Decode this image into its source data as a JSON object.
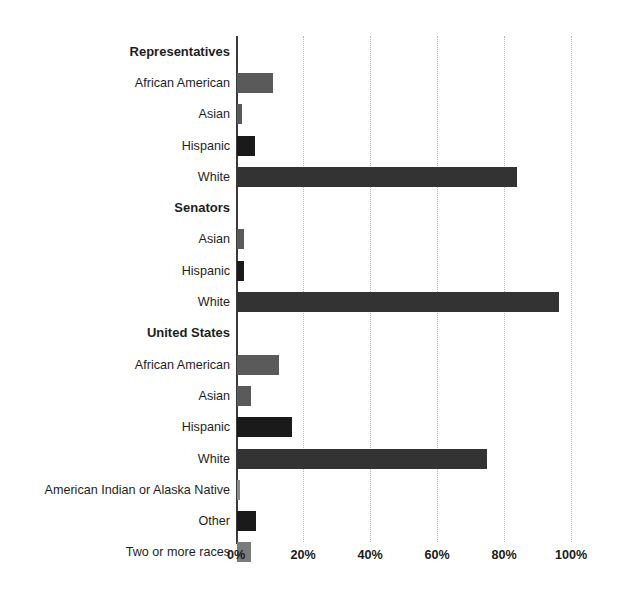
{
  "chart_data": {
    "type": "bar",
    "orientation": "horizontal",
    "title": "",
    "subtitle": "",
    "xlabel": "",
    "ylabel": "",
    "xlim": [
      0,
      100
    ],
    "grid": "vertical-dotted",
    "legend": "none",
    "xticks": [
      "0%",
      "20%",
      "40%",
      "60%",
      "80%",
      "100%"
    ],
    "xtick_values": [
      0,
      20,
      40,
      60,
      80,
      100
    ],
    "groups": [
      {
        "name": "Representatives",
        "rows": [
          {
            "label": "African American",
            "value": 10.8,
            "color": "#5a5a5a"
          },
          {
            "label": "Asian",
            "value": 1.6,
            "color": "#5a5a5a"
          },
          {
            "label": "Hispanic",
            "value": 5.3,
            "color": "#1a1a1a"
          },
          {
            "label": "White",
            "value": 83.5,
            "color": "#333333"
          }
        ]
      },
      {
        "name": "Senators",
        "rows": [
          {
            "label": "Asian",
            "value": 2.0,
            "color": "#5a5a5a"
          },
          {
            "label": "Hispanic",
            "value": 2.0,
            "color": "#1a1a1a"
          },
          {
            "label": "White",
            "value": 96.0,
            "color": "#333333"
          }
        ]
      },
      {
        "name": "United States",
        "rows": [
          {
            "label": "African American",
            "value": 12.6,
            "color": "#5a5a5a"
          },
          {
            "label": "Asian",
            "value": 4.2,
            "color": "#5a5a5a"
          },
          {
            "label": "Hispanic",
            "value": 16.4,
            "color": "#1a1a1a"
          },
          {
            "label": "White",
            "value": 74.6,
            "color": "#333333"
          },
          {
            "label": "American Indian or Alaska Native",
            "value": 1.0,
            "color": "#8a8a8a"
          },
          {
            "label": "Other",
            "value": 5.6,
            "color": "#1a1a1a"
          },
          {
            "label": "Two or more races",
            "value": 4.2,
            "color": "#7a7a7a"
          }
        ]
      }
    ]
  },
  "colors": {
    "background": "#ffffff",
    "axis": "#3b3b3b",
    "gridline": "#b9b9b9",
    "text": "#1a1a1a",
    "bar_gray": "#5a5a5a",
    "bar_dark": "#1a1a1a",
    "bar_white_category": "#333333"
  }
}
